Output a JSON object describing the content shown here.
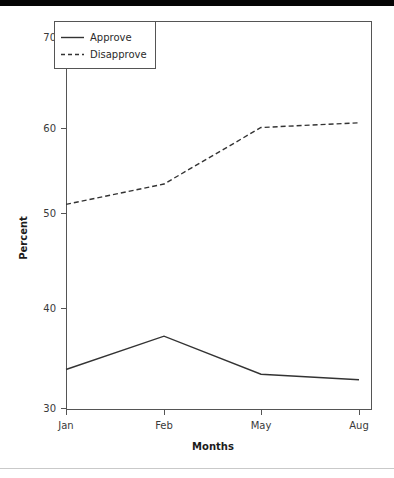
{
  "chart_data": {
    "type": "line",
    "title": "",
    "xlabel": "Months",
    "ylabel": "Percent",
    "categories": [
      "Jan",
      "Feb",
      "May",
      "Aug"
    ],
    "series": [
      {
        "name": "Approve",
        "style": "solid",
        "color": "#333333",
        "values": [
          34.2,
          37.8,
          33.7,
          33.1
        ]
      },
      {
        "name": "Disapprove",
        "style": "dashed",
        "color": "#333333",
        "values": [
          52.0,
          54.2,
          60.3,
          60.8
        ]
      }
    ],
    "ylim": [
      30,
      70
    ],
    "yticks": [
      30,
      40,
      50,
      60,
      70
    ],
    "ytick_labels": [
      "30",
      "40",
      "50",
      "60",
      "70"
    ],
    "xtick_labels": [
      "Jan",
      "Feb",
      "May",
      "Aug"
    ],
    "grid": false,
    "legend_position": "top-left",
    "frame": true
  },
  "axes": {
    "y_title": "Percent",
    "x_title": "Months",
    "y_ticks": [
      {
        "label": "70",
        "value": 70
      },
      {
        "label": "60",
        "value": 60
      },
      {
        "label": "50",
        "value": 50
      },
      {
        "label": "40",
        "value": 40
      },
      {
        "label": "30",
        "value": 30
      }
    ],
    "x_ticks": [
      {
        "label": "Jan",
        "index": 0
      },
      {
        "label": "Feb",
        "index": 1
      },
      {
        "label": "May",
        "index": 2
      },
      {
        "label": "Aug",
        "index": 3
      }
    ]
  },
  "legend": {
    "entries": [
      {
        "label": "Approve",
        "style": "solid"
      },
      {
        "label": "Disapprove",
        "style": "dashed"
      }
    ]
  },
  "colors": {
    "line": "#333333",
    "frame": "#555555",
    "tick_text": "#3a3a3a",
    "title_text": "#1c1c1c",
    "top_bar": "#050505",
    "divider": "#c9c9c9",
    "background": "#ffffff"
  }
}
